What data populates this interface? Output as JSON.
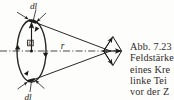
{
  "figure": {
    "background_color": "#fdfdfc",
    "ink_color": "#1d1b19",
    "labels": {
      "dl_top": "dl",
      "dl_bottom": "dl",
      "radius_a": "a",
      "distance_r": "r"
    },
    "axis": {
      "style": "dash-dot",
      "label": "symmetry-axis"
    },
    "loop": {
      "shape": "ellipse",
      "description": "current loop seen in perspective",
      "current_direction_arrows": 4
    },
    "field_vectors": {
      "shape": "rhombus",
      "description": "dB contributions adding to axial resultant",
      "resultant_arrow": "horizontal"
    }
  },
  "caption": {
    "lines": [
      "Abb. 7.23",
      "Feldstärke",
      "eines Kre",
      "linke Tei",
      "vor der Z"
    ],
    "full_text": "Abb. 7.23 Feldstärke eines Kre linke Tei vor der Z",
    "color": "#2e2b28"
  }
}
